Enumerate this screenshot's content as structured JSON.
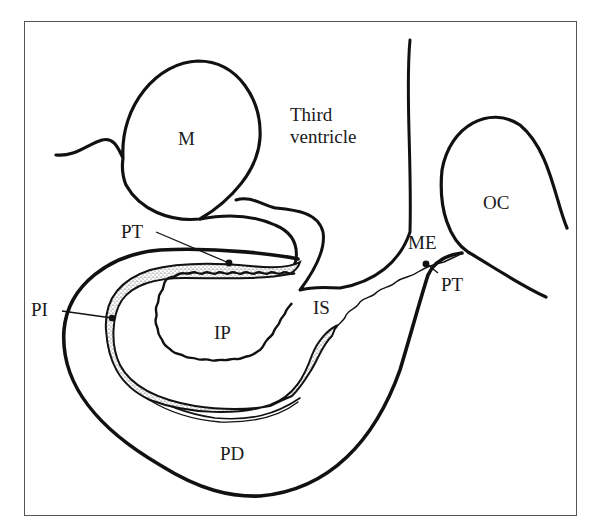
{
  "figure": {
    "type": "anatomical-diagram",
    "colors": {
      "line": "#111111",
      "frame": "#555555",
      "background": "#ffffff",
      "stipple": "#333333"
    },
    "labels": {
      "M": "M",
      "third_ventricle_line1": "Third",
      "third_ventricle_line2": "ventricle",
      "OC": "OC",
      "ME": "ME",
      "PT_upper": "PT",
      "PT_right": "PT",
      "PI": "PI",
      "IP": "IP",
      "IS": "IS",
      "PD": "PD"
    }
  }
}
